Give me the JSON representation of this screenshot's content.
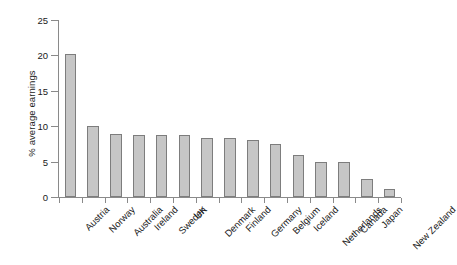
{
  "chart_data": {
    "type": "bar",
    "title": "",
    "subtitle": "",
    "xlabel": "",
    "ylabel": "% average earnings",
    "ylim": [
      0,
      25
    ],
    "yticks": [
      0,
      5,
      10,
      15,
      20,
      25
    ],
    "ytick_labels": [
      "0",
      "5",
      "10",
      "15",
      "20",
      "25"
    ],
    "grid": false,
    "legend": null,
    "bar_color": "#c6c6c6",
    "bar_edge_color": "#7d7d7d",
    "axis_color": "#8a8a8a",
    "text_color": "#1a1a1a",
    "categories": [
      "Austria",
      "Norway",
      "Australia",
      "Ireland",
      "Sweden",
      "UK",
      "Denmark",
      "Finland",
      "Germany",
      "Belgium",
      "Iceland",
      "Netherlands",
      "Canada",
      "Japan",
      "New Zealand"
    ],
    "values": [
      20.2,
      10.0,
      8.9,
      8.8,
      8.7,
      8.7,
      8.4,
      8.3,
      8.0,
      7.5,
      6.0,
      4.9,
      4.9,
      2.6,
      1.2
    ]
  }
}
